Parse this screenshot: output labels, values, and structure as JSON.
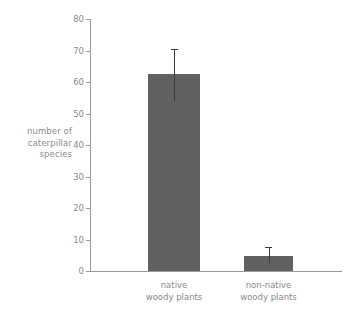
{
  "chart_data": {
    "type": "bar",
    "title": "",
    "subtitle": "",
    "xlabel": "",
    "ylabel": "number of caterpillar species",
    "ylabel_lines": [
      "number of",
      "caterpillar",
      "species"
    ],
    "categories": [
      "native woody plants",
      "non-native woody plants"
    ],
    "category_lines": [
      [
        "native",
        "woody plants"
      ],
      [
        "non-native",
        "woody plants"
      ]
    ],
    "values": [
      62.5,
      4.8
    ],
    "errors_low": [
      54.0,
      2.5
    ],
    "errors_high": [
      70.5,
      7.5
    ],
    "ylim": [
      0,
      80
    ],
    "yticks": [
      0,
      10,
      20,
      30,
      40,
      50,
      60,
      70,
      80
    ],
    "ytick_labels": [
      "0",
      "10",
      "20",
      "30",
      "40",
      "50",
      "60",
      "70",
      "80"
    ],
    "grid": false,
    "legend": false,
    "legend_position": "none",
    "bar_color": "#616161",
    "error_color": "#3a3a3a",
    "axis_color": "#9a9a9a",
    "text_color": "#8a8a8a",
    "background": "#ffffff"
  }
}
